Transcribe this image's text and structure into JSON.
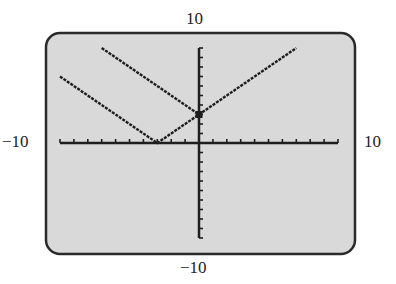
{
  "chart_data": {
    "type": "line",
    "title": "",
    "xlabel": "",
    "ylabel": "",
    "window": {
      "xmin": -10,
      "xmax": 10,
      "ymin": -10,
      "ymax": 10,
      "xscl": 1,
      "yscl": 1
    },
    "grid": false,
    "legend": null,
    "window_labels": {
      "top": "10",
      "left": "-10",
      "right": "10",
      "bottom": "-10"
    },
    "series": [
      {
        "name": "y = |x + 3|",
        "x": [
          -10,
          -3,
          0
        ],
        "y": [
          7,
          0,
          3
        ]
      },
      {
        "name": "y = |x| + 3",
        "x": [
          -7,
          0,
          7
        ],
        "y": [
          10,
          3,
          10
        ]
      }
    ],
    "annotations": [
      {
        "type": "point",
        "x": 0,
        "y": 3,
        "label": "intersection"
      }
    ]
  },
  "labels": {
    "top": "10",
    "left": "−10",
    "right": "10",
    "bottom": "−10"
  },
  "colors": {
    "screen_bg": "#d9d9d9",
    "ink": "#1e1e1e",
    "border": "#2a2a2a"
  }
}
